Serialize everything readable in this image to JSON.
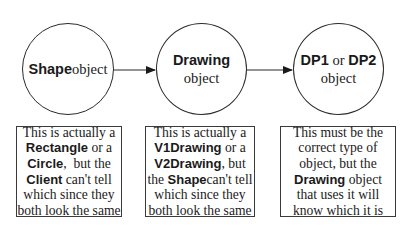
{
  "diagram": {
    "nodes": [
      {
        "id": "shape",
        "lines": [
          [
            {
              "text": "Shape",
              "style": "bold"
            },
            {
              "text": "object",
              "style": "normal"
            }
          ]
        ]
      },
      {
        "id": "drawing",
        "lines": [
          [
            {
              "text": "Drawing",
              "style": "bold"
            }
          ],
          [
            {
              "text": "object",
              "style": "normal"
            }
          ]
        ]
      },
      {
        "id": "dp",
        "lines": [
          [
            {
              "text": "DP1",
              "style": "bold"
            },
            {
              "text": " or ",
              "style": "normal"
            },
            {
              "text": "DP2",
              "style": "bold"
            }
          ],
          [
            {
              "text": "object",
              "style": "normal"
            }
          ]
        ]
      }
    ],
    "edges": [
      {
        "from": "shape",
        "to": "drawing",
        "type": "arrow"
      },
      {
        "from": "drawing",
        "to": "dp",
        "type": "arrow"
      }
    ],
    "notes": [
      {
        "node": "shape",
        "lines": [
          [
            {
              "text": "This is actually a",
              "style": "normal"
            }
          ],
          [
            {
              "text": "Rectangle",
              "style": "bold"
            },
            {
              "text": " or a",
              "style": "normal"
            }
          ],
          [
            {
              "text": "Circle",
              "style": "bold"
            },
            {
              "text": ",  but the",
              "style": "normal"
            }
          ],
          [
            {
              "text": "Client",
              "style": "bold"
            },
            {
              "text": " can't tell",
              "style": "normal"
            }
          ],
          [
            {
              "text": "which since they",
              "style": "normal"
            }
          ],
          [
            {
              "text": "both look the same",
              "style": "normal"
            }
          ]
        ]
      },
      {
        "node": "drawing",
        "lines": [
          [
            {
              "text": "This is actually a",
              "style": "normal"
            }
          ],
          [
            {
              "text": "V1Drawing",
              "style": "bold"
            },
            {
              "text": " or a",
              "style": "normal"
            }
          ],
          [
            {
              "text": "V2Drawing",
              "style": "bold"
            },
            {
              "text": ", but",
              "style": "normal"
            }
          ],
          [
            {
              "text": "the ",
              "style": "normal"
            },
            {
              "text": "Shape",
              "style": "bold"
            },
            {
              "text": "can't tell",
              "style": "normal"
            }
          ],
          [
            {
              "text": "which since they",
              "style": "normal"
            }
          ],
          [
            {
              "text": "both look the same",
              "style": "normal"
            }
          ]
        ]
      },
      {
        "node": "dp",
        "lines": [
          [
            {
              "text": "This must be the",
              "style": "normal"
            }
          ],
          [
            {
              "text": "correct type of",
              "style": "normal"
            }
          ],
          [
            {
              "text": "object, but the",
              "style": "normal"
            }
          ],
          [
            {
              "text": "Drawing",
              "style": "bold"
            },
            {
              "text": " object",
              "style": "normal"
            }
          ],
          [
            {
              "text": "that uses it will",
              "style": "normal"
            }
          ],
          [
            {
              "text": "know which it is",
              "style": "normal"
            }
          ]
        ]
      }
    ],
    "colors": {
      "stroke": "#2a2a2a",
      "text": "#1a1a1a",
      "background": "#ffffff"
    }
  }
}
